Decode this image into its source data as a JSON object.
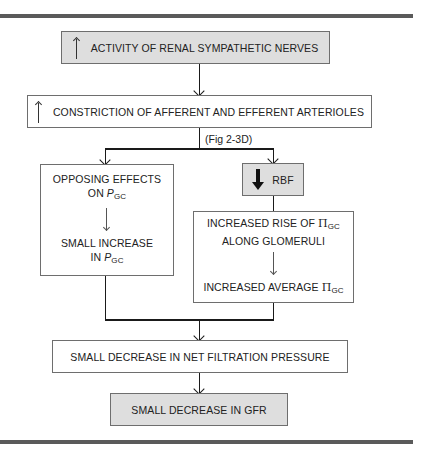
{
  "diagram": {
    "boxes": {
      "sympathetic": {
        "arrow": "up-arrow",
        "label": "ACTIVITY OF RENAL SYMPATHETIC NERVES"
      },
      "constriction": {
        "arrow": "up-arrow",
        "label": "CONSTRICTION OF AFFERENT AND EFFERENT ARTERIOLES"
      },
      "opposing": {
        "line1": "OPPOSING EFFECTS",
        "line2_prefix": "ON ",
        "var": "P",
        "sub": "GC",
        "line3": "SMALL INCREASE",
        "line4_prefix": "IN ",
        "var2": "P",
        "sub2": "GC"
      },
      "rbf": {
        "arrow": "down-arrow-thick",
        "label": "RBF"
      },
      "oncotic": {
        "line1_prefix": "INCREASED RISE OF ",
        "symbol": "Π",
        "sub": "GC",
        "line2": "ALONG GLOMERULI",
        "line3_prefix": "INCREASED AVERAGE ",
        "symbol2": "Π",
        "sub2": "GC"
      },
      "net_filtration": {
        "label": "SMALL DECREASE IN NET FILTRATION PRESSURE"
      },
      "gfr": {
        "label": "SMALL DECREASE IN GFR"
      }
    },
    "annotation": "(Fig 2-3D)",
    "colors": {
      "shaded_fill": "#dedede",
      "border": "#6e6e6e",
      "rule": "#5a5a5a",
      "line": "#1a1a1a"
    }
  }
}
